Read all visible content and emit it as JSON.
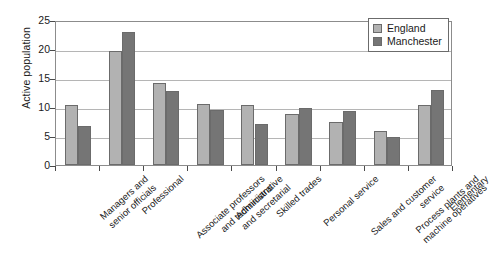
{
  "chart_data": {
    "type": "bar",
    "title": "",
    "xlabel": "",
    "ylabel": "Active population",
    "ylim": [
      0,
      25
    ],
    "yticks": [
      0,
      5,
      10,
      15,
      20,
      25
    ],
    "grid": true,
    "legend_position": "top-right",
    "categories": [
      "Managers and senior officials",
      "Professional",
      "Associate professors and technicians",
      "Administrative and secretarial",
      "Skilled trades",
      "Personal service",
      "Sales and customer service",
      "Process plants and machine operatives",
      "Elementary"
    ],
    "category_lines": [
      [
        "Managers and",
        "senior officials"
      ],
      [
        "Professional"
      ],
      [
        "Associate professors",
        "and technicians"
      ],
      [
        "Administrative",
        "and secretarial"
      ],
      [
        "Skilled trades"
      ],
      [
        "Personal service"
      ],
      [
        "Sales and customer",
        "service"
      ],
      [
        "Process plants and",
        "machine operatives"
      ],
      [
        "Elementary"
      ]
    ],
    "series": [
      {
        "name": "England",
        "color": "#b2b2b2",
        "values": [
          10.3,
          19.7,
          14.1,
          10.5,
          10.4,
          8.8,
          7.5,
          5.8,
          10.4
        ]
      },
      {
        "name": "Manchester",
        "color": "#757575",
        "values": [
          6.8,
          23.0,
          12.7,
          9.4,
          7.0,
          9.9,
          9.3,
          4.9,
          13.0
        ]
      }
    ]
  },
  "legend": {
    "entries": [
      {
        "label": "England"
      },
      {
        "label": "Manchester"
      }
    ]
  },
  "axis": {
    "y_title": "Active population"
  }
}
